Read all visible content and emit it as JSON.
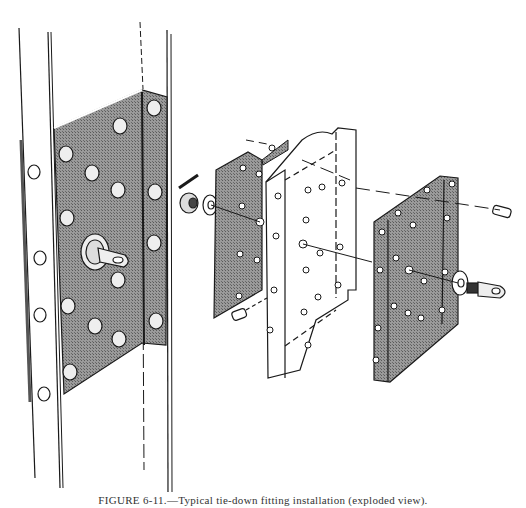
{
  "figure": {
    "caption": "FIGURE 6-11.—Typical tie-down fitting installation (exploded view).",
    "colors": {
      "ink": "#1a1a1a",
      "plate_shade": "#8a8a8a",
      "paper": "#ffffff"
    },
    "parts": [
      {
        "id": "vertical-beam",
        "label": "Vertical channel member (assembled view)"
      },
      {
        "id": "assembled-doubler-plate",
        "label": "Shaded doubler plate with rivets"
      },
      {
        "id": "assembled-eye-fitting",
        "label": "Eye fitting installed"
      },
      {
        "id": "front-plate",
        "label": "Front shaded plate (exploded)"
      },
      {
        "id": "middle-channel",
        "label": "Channel section (exploded, broken)"
      },
      {
        "id": "rear-angle-plate",
        "label": "Rear shaded angle plate (exploded)"
      },
      {
        "id": "eye-bolt-fitting",
        "label": "Eye bolt with washer"
      },
      {
        "id": "nut-washer-cotter",
        "label": "Castle nut, washer and cotter pin"
      },
      {
        "id": "bolt-upper",
        "label": "Bolt (upper right)"
      },
      {
        "id": "bolt-lower",
        "label": "Bolt (lower left)"
      }
    ]
  }
}
